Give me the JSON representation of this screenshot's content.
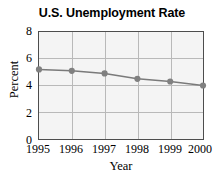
{
  "chart_data": {
    "type": "line",
    "title": "U.S. Unemployment Rate",
    "xlabel": "Year",
    "ylabel": "Percent",
    "categories": [
      "1995",
      "1996",
      "1997",
      "1998",
      "1999",
      "2000"
    ],
    "x": [
      1995,
      1996,
      1997,
      1998,
      1999,
      2000
    ],
    "values": [
      5.2,
      5.1,
      4.9,
      4.5,
      4.3,
      4.0
    ],
    "series": [
      {
        "name": "U.S. Unemployment Rate",
        "values": [
          5.2,
          5.1,
          4.9,
          4.5,
          4.3,
          4.0
        ]
      }
    ],
    "ylim": [
      0,
      8
    ],
    "yticks": [
      "0",
      "2",
      "4",
      "6",
      "8"
    ],
    "ytick_values": [
      0,
      2,
      4,
      6,
      8
    ],
    "xlim": [
      1995,
      2000
    ],
    "grid": true,
    "legend": false,
    "legend_position": "none",
    "marker": "circle",
    "colors": {
      "line": "#7a7a7a",
      "marker": "#808080",
      "plot_background": "#f4f4f4",
      "gridline": "#b9b9b9",
      "axis": "#4d4d4d",
      "text": "#000000",
      "page_background": "#ffffff"
    }
  }
}
